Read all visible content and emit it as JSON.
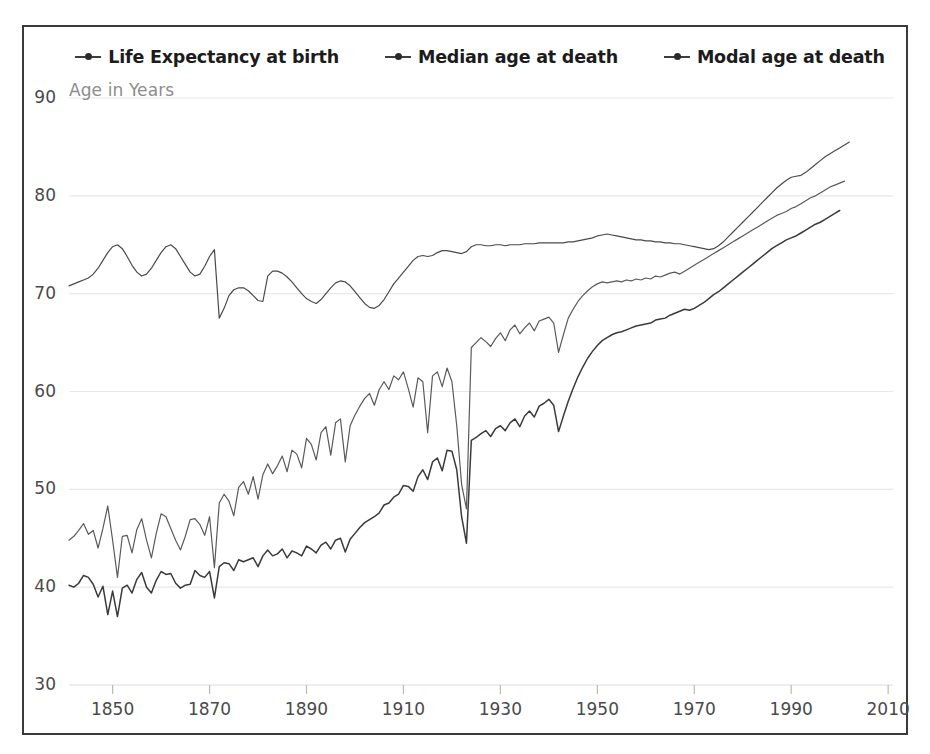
{
  "chart_data": {
    "type": "line",
    "title": "",
    "subtitle": "",
    "xlabel": "",
    "ylabel": "Age in Years",
    "ylabel_position": "top-left-inside",
    "xlim": [
      1841,
      2011
    ],
    "ylim": [
      30,
      92
    ],
    "xticks": [
      1850,
      1870,
      1890,
      1910,
      1930,
      1950,
      1970,
      1990,
      2010
    ],
    "yticks": [
      30,
      40,
      50,
      60,
      70,
      80,
      90
    ],
    "grid": "horizontal",
    "legend_position": "top-center-outside",
    "legend": [
      "Life Expectancy at birth",
      "Median age at death",
      "Modal age at death"
    ],
    "x_step": 1,
    "x_start": 1841,
    "series": [
      {
        "name": "Life Expectancy at birth",
        "color": "#3a3a3a",
        "marker": "line-dot",
        "values": [
          40.2,
          40.0,
          40.4,
          41.2,
          41.0,
          40.3,
          39.0,
          40.1,
          37.2,
          39.6,
          37.0,
          39.9,
          40.2,
          39.4,
          40.8,
          41.5,
          40.0,
          39.4,
          40.7,
          41.6,
          41.3,
          41.4,
          40.4,
          39.9,
          40.2,
          40.3,
          41.7,
          41.2,
          41.0,
          41.6,
          38.9,
          42.1,
          42.5,
          42.4,
          41.7,
          42.8,
          42.6,
          42.8,
          43.0,
          42.1,
          43.2,
          43.8,
          43.2,
          43.4,
          43.9,
          43.0,
          43.7,
          43.5,
          43.2,
          44.2,
          43.9,
          43.5,
          44.3,
          44.6,
          43.9,
          44.8,
          45.0,
          43.6,
          44.9,
          45.5,
          46.1,
          46.6,
          46.9,
          47.2,
          47.6,
          48.4,
          48.6,
          49.2,
          49.5,
          50.4,
          50.3,
          49.8,
          51.3,
          52.0,
          51.0,
          52.8,
          53.2,
          51.9,
          54.0,
          53.9,
          52.0,
          47.2,
          44.5,
          55.0,
          55.3,
          55.7,
          56.0,
          55.4,
          56.2,
          56.5,
          56.0,
          56.8,
          57.2,
          56.4,
          57.5,
          58.0,
          57.4,
          58.5,
          58.8,
          59.2,
          58.6,
          55.9,
          57.5,
          59.0,
          60.3,
          61.5,
          62.5,
          63.4,
          64.1,
          64.7,
          65.2,
          65.5,
          65.8,
          66.0,
          66.1,
          66.3,
          66.5,
          66.7,
          66.8,
          66.9,
          67.0,
          67.3,
          67.4,
          67.5,
          67.8,
          68.0,
          68.2,
          68.4,
          68.3,
          68.5,
          68.8,
          69.1,
          69.5,
          69.9,
          70.2,
          70.6,
          71.0,
          71.4,
          71.8,
          72.2,
          72.6,
          73.0,
          73.4,
          73.8,
          74.2,
          74.6,
          74.9,
          75.2,
          75.5,
          75.7,
          75.9,
          76.2,
          76.5,
          76.8,
          77.1,
          77.3,
          77.6,
          77.9,
          78.2,
          78.5
        ]
      },
      {
        "name": "Median age at death",
        "color": "#5a5a5a",
        "marker": "line-dot",
        "values": [
          44.8,
          45.2,
          45.8,
          46.5,
          45.4,
          45.8,
          44.0,
          46.0,
          48.3,
          44.8,
          41.0,
          45.2,
          45.3,
          43.5,
          45.9,
          47.0,
          44.8,
          43.0,
          45.5,
          47.5,
          47.2,
          46.0,
          44.8,
          43.8,
          45.2,
          46.9,
          47.0,
          46.4,
          45.3,
          47.2,
          42.0,
          48.6,
          49.5,
          48.8,
          47.3,
          50.2,
          50.8,
          49.5,
          51.3,
          49.0,
          51.5,
          52.6,
          51.6,
          52.4,
          53.4,
          51.8,
          54.0,
          53.6,
          52.2,
          55.2,
          54.6,
          53.0,
          55.8,
          56.4,
          53.5,
          56.8,
          57.2,
          52.8,
          56.5,
          57.6,
          58.5,
          59.3,
          59.8,
          58.6,
          60.2,
          61.0,
          60.2,
          61.6,
          61.2,
          62.0,
          60.3,
          58.4,
          61.4,
          61.0,
          55.8,
          61.6,
          62.0,
          60.5,
          62.4,
          61.0,
          56.5,
          50.5,
          48.0,
          64.5,
          65.0,
          65.5,
          65.1,
          64.6,
          65.4,
          66.0,
          65.2,
          66.3,
          66.8,
          65.9,
          66.5,
          67.0,
          66.2,
          67.2,
          67.4,
          67.6,
          67.0,
          64.0,
          65.8,
          67.5,
          68.4,
          69.2,
          69.8,
          70.3,
          70.7,
          71.0,
          71.2,
          71.1,
          71.2,
          71.3,
          71.2,
          71.4,
          71.3,
          71.5,
          71.4,
          71.6,
          71.5,
          71.8,
          71.7,
          71.9,
          72.1,
          72.2,
          72.0,
          72.3,
          72.6,
          72.9,
          73.2,
          73.5,
          73.8,
          74.1,
          74.4,
          74.7,
          75.0,
          75.3,
          75.6,
          75.9,
          76.2,
          76.5,
          76.8,
          77.1,
          77.4,
          77.7,
          78.0,
          78.2,
          78.4,
          78.7,
          78.9,
          79.2,
          79.5,
          79.8,
          80.0,
          80.3,
          80.6,
          80.9,
          81.1,
          81.3,
          81.5
        ]
      },
      {
        "name": "Modal age at death",
        "color": "#4a4a4a",
        "marker": "line-dot",
        "values": [
          70.8,
          71.0,
          71.2,
          71.4,
          71.6,
          72.0,
          72.6,
          73.4,
          74.2,
          74.8,
          75.0,
          74.6,
          73.8,
          72.9,
          72.2,
          71.8,
          72.0,
          72.6,
          73.4,
          74.2,
          74.8,
          75.0,
          74.6,
          73.8,
          73.0,
          72.2,
          71.8,
          72.0,
          72.8,
          73.8,
          74.5,
          67.5,
          68.5,
          69.8,
          70.4,
          70.6,
          70.6,
          70.3,
          69.8,
          69.3,
          69.2,
          71.8,
          72.3,
          72.3,
          72.1,
          71.7,
          71.2,
          70.6,
          70.0,
          69.5,
          69.2,
          69.0,
          69.4,
          70.0,
          70.6,
          71.1,
          71.3,
          71.2,
          70.8,
          70.2,
          69.6,
          69.0,
          68.6,
          68.5,
          68.8,
          69.4,
          70.2,
          71.0,
          71.6,
          72.2,
          72.8,
          73.4,
          73.8,
          73.9,
          73.8,
          73.9,
          74.2,
          74.4,
          74.4,
          74.3,
          74.2,
          74.1,
          74.3,
          74.8,
          75.0,
          75.0,
          74.9,
          74.9,
          75.0,
          75.0,
          74.9,
          75.0,
          75.0,
          75.0,
          75.1,
          75.1,
          75.1,
          75.2,
          75.2,
          75.2,
          75.2,
          75.2,
          75.2,
          75.3,
          75.3,
          75.4,
          75.5,
          75.6,
          75.7,
          75.9,
          76.0,
          76.1,
          76.0,
          75.9,
          75.8,
          75.7,
          75.6,
          75.5,
          75.5,
          75.4,
          75.4,
          75.3,
          75.3,
          75.2,
          75.2,
          75.1,
          75.1,
          75.0,
          74.9,
          74.8,
          74.7,
          74.6,
          74.5,
          74.6,
          74.9,
          75.3,
          75.8,
          76.3,
          76.8,
          77.3,
          77.8,
          78.3,
          78.8,
          79.3,
          79.8,
          80.3,
          80.8,
          81.2,
          81.6,
          81.9,
          82.0,
          82.1,
          82.4,
          82.8,
          83.2,
          83.6,
          84.0,
          84.3,
          84.6,
          84.9,
          85.2,
          85.5
        ]
      }
    ]
  },
  "axis": {
    "y_note": "Age in Years",
    "ytick_labels": [
      "90",
      "80",
      "70",
      "60",
      "50",
      "40",
      "30"
    ],
    "xtick_labels": [
      "1850",
      "1870",
      "1890",
      "1910",
      "1930",
      "1950",
      "1970",
      "1990",
      "2010"
    ]
  },
  "legend": {
    "items": [
      {
        "label": "Life Expectancy at birth"
      },
      {
        "label": "Median age at death"
      },
      {
        "label": "Modal age at death"
      }
    ]
  },
  "colors": {
    "frame": "#3a3a3a",
    "grid": "#e8e8e8",
    "axis_text": "#4a4a4a",
    "note_text": "#8d8d8d",
    "legend_text": "#1c1c1c"
  }
}
